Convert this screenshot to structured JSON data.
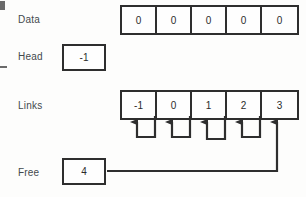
{
  "diagram": {
    "rows": {
      "data": {
        "label": "Data",
        "cells": [
          "0",
          "0",
          "0",
          "0",
          "0"
        ]
      },
      "head": {
        "label": "Head",
        "value": "-1"
      },
      "links": {
        "label": "Links",
        "cells": [
          "-1",
          "0",
          "1",
          "2",
          "3"
        ]
      },
      "free": {
        "label": "Free",
        "value": "4"
      }
    },
    "connectors": {
      "count": 5,
      "description": "Each links cell loops back to point at the cell to its left; the Free box feeds the rightmost arrow.",
      "arrow_targets": [
        "-1",
        "0",
        "1",
        "2",
        "3"
      ]
    },
    "colors": {
      "stroke": "#2e2e2e",
      "text": "#2b2b2b",
      "label": "#43494d",
      "background": "#fdfdfc"
    }
  }
}
